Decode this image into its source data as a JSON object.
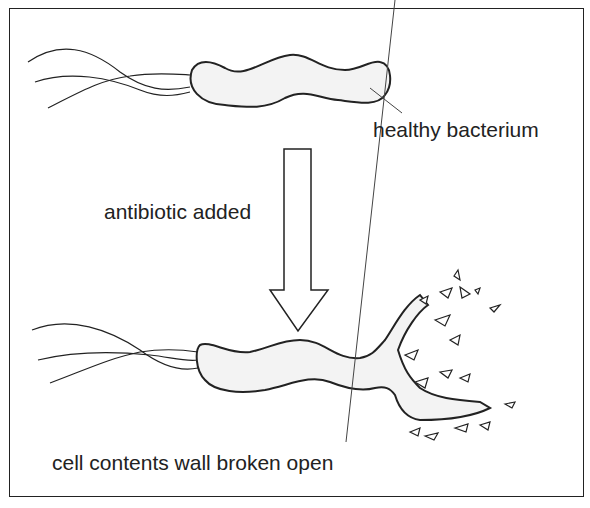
{
  "diagram": {
    "labels": {
      "healthy": "healthy bacterium",
      "antibiotic": "antibiotic added",
      "broken": "cell contents wall broken open"
    },
    "icons": [
      "bacterium-icon",
      "flagella-icon",
      "down-arrow-icon",
      "debris-icon"
    ],
    "colors": {
      "line": "#222222",
      "fill": "#f4f4f4",
      "background": "#ffffff"
    }
  }
}
